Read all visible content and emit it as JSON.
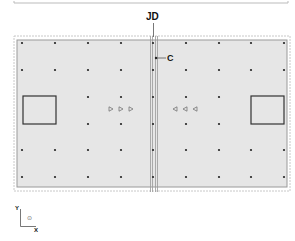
{
  "labels": {
    "joint": "JD",
    "column": "C",
    "axis_y": "Y",
    "axis_x": "X",
    "axis_origin": "⊙"
  },
  "colors": {
    "slab_fill": "#e6e6e6",
    "outline": "#9a9a9a",
    "dot": "#222222",
    "rect": "#333333",
    "triangle": "#666666",
    "text": "#111111"
  },
  "grid": {
    "columns_x": [
      22,
      55,
      88,
      121,
      153,
      186,
      219,
      251,
      284
    ],
    "rows_y": [
      43,
      70,
      97,
      124,
      150,
      177
    ]
  },
  "openings": [
    {
      "side": "left",
      "x": 23,
      "y": 96,
      "w": 33,
      "h": 28
    },
    {
      "side": "right",
      "x": 251,
      "y": 96,
      "w": 33,
      "h": 28
    }
  ],
  "triangles": {
    "right_pointing_x": [
      111,
      121,
      131
    ],
    "left_pointing_x": [
      175,
      185,
      195
    ],
    "y": 109
  }
}
